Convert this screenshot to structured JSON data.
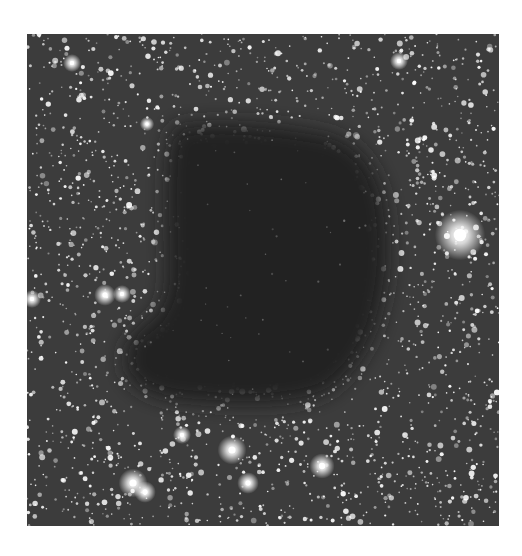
{
  "image": {
    "subject": "dark nebula against dense star field",
    "frame": {
      "x": 27,
      "y": 34,
      "width": 472,
      "height": 492
    },
    "colors": {
      "page_background": "#ffffff",
      "sky_background": "#3c3c3c",
      "cloud": "#232323",
      "star": "#ffffff"
    },
    "dark_cloud": {
      "path": "M150,92 C190,86 250,90 300,100 C330,108 350,130 358,170 C364,210 362,250 350,290 C340,320 320,345 300,358 C270,372 220,372 170,368 C130,366 108,356 100,340 C94,320 100,300 118,290 C134,282 140,262 140,240 C140,200 138,160 140,130 C142,108 144,96 150,92 Z"
    },
    "bright_stars": [
      {
        "x": 433,
        "y": 201,
        "r": 14
      },
      {
        "x": 205,
        "y": 416,
        "r": 8
      },
      {
        "x": 106,
        "y": 449,
        "r": 8
      },
      {
        "x": 118,
        "y": 458,
        "r": 6
      },
      {
        "x": 221,
        "y": 449,
        "r": 6
      },
      {
        "x": 295,
        "y": 432,
        "r": 7
      },
      {
        "x": 155,
        "y": 401,
        "r": 5
      },
      {
        "x": 78,
        "y": 261,
        "r": 6
      },
      {
        "x": 95,
        "y": 260,
        "r": 5
      },
      {
        "x": 5,
        "y": 265,
        "r": 5
      },
      {
        "x": 45,
        "y": 29,
        "r": 5
      },
      {
        "x": 372,
        "y": 27,
        "r": 5
      },
      {
        "x": 120,
        "y": 90,
        "r": 4
      }
    ],
    "star_field": {
      "seed": 68,
      "count": 2600
    }
  }
}
